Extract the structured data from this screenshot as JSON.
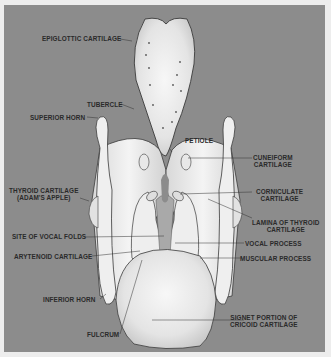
{
  "figure": {
    "colors": {
      "background": "#8c8c8c",
      "border": "#ededed",
      "cartilage": "#ececec",
      "outline": "#3a3a3a",
      "label_text": "#2a2a2a"
    },
    "labels": {
      "epiglottic_cartilage": "EPIGLOTTIC CARTILAGE",
      "tubercle": "TUBERCLE",
      "superior_horn": "SUPERIOR HORN",
      "petiole": "PETIOLE",
      "cuneiform_1": "CUNEIFORM",
      "cuneiform_2": "CARTILAGE",
      "corniculate_1": "CORNICULATE",
      "corniculate_2": "CARTILAGE",
      "thyroid_1": "THYROID CARTILAGE",
      "thyroid_2": "(ADAM'S APPLE)",
      "lamina_1": "LAMINA OF THYROID",
      "lamina_2": "CARTILAGE",
      "site_vocal_folds": "SITE OF VOCAL FOLDS",
      "vocal_process": "VOCAL PROCESS",
      "arytenoid": "ARYTENOID CARTILAGE",
      "muscular_process": "MUSCULAR PROCESS",
      "inferior_horn": "INFERIOR HORN",
      "signet_1": "SIGNET PORTION OF",
      "signet_2": "CRICOID CARTILAGE",
      "fulcrum": "FULCRUM"
    }
  }
}
